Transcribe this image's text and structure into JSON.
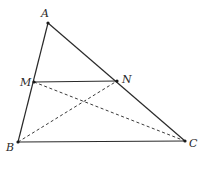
{
  "diagram": {
    "type": "triangle-with-midsegment",
    "points": {
      "A": {
        "label": "A",
        "x": 48,
        "y": 23,
        "lx": 41,
        "ly": 17
      },
      "M": {
        "label": "M",
        "x": 34,
        "y": 82,
        "lx": 20,
        "ly": 86
      },
      "N": {
        "label": "N",
        "x": 117,
        "y": 81,
        "lx": 122,
        "ly": 83
      },
      "B": {
        "label": "B",
        "x": 18,
        "y": 142,
        "lx": 6,
        "ly": 151
      },
      "C": {
        "label": "C",
        "x": 185,
        "y": 141,
        "lx": 189,
        "ly": 147
      }
    },
    "solid_segments": [
      [
        "A",
        "B"
      ],
      [
        "A",
        "C"
      ],
      [
        "B",
        "C"
      ],
      [
        "M",
        "N"
      ]
    ],
    "dashed_segments": [
      [
        "M",
        "C"
      ],
      [
        "B",
        "N"
      ]
    ]
  }
}
